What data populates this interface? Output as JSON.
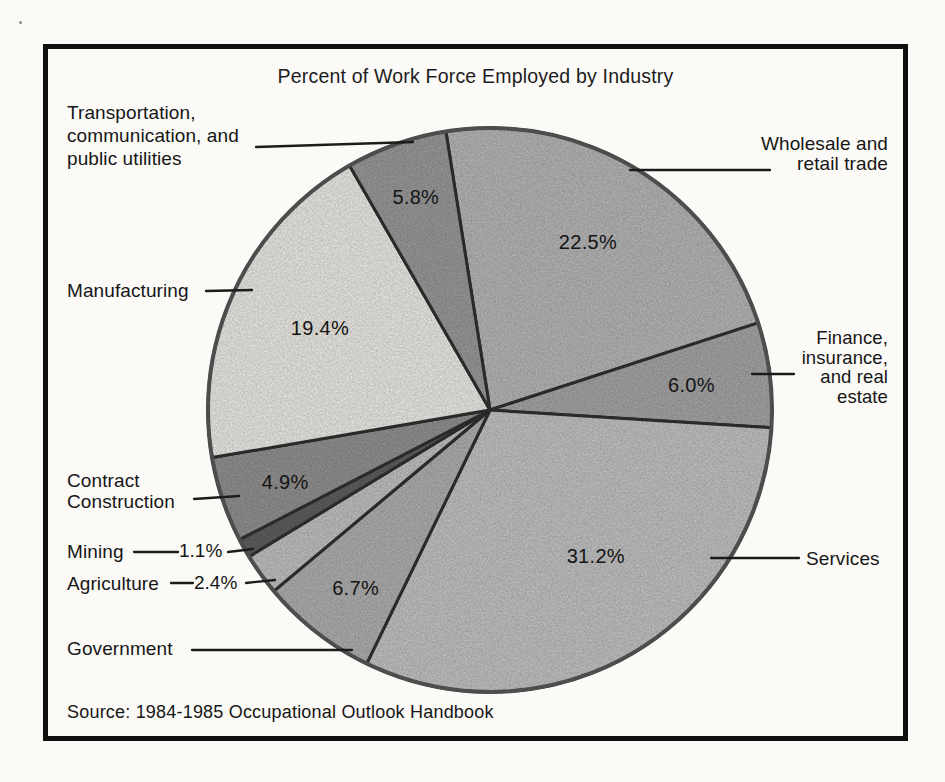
{
  "figure": {
    "title": "Percent of Work Force Employed by Industry",
    "source": "Source: 1984-1985 Occupational Outlook Handbook"
  },
  "chart_data": {
    "type": "pie",
    "title": "Percent of Work Force Employed by Industry",
    "unit": "percent of work force",
    "start_angle_deg": -9,
    "direction": "clockwise",
    "legend_position": "outside-callouts",
    "slices": [
      {
        "key": "wholesale",
        "label": "Wholesale and retail trade",
        "value": 22.5,
        "pct": "22.5%",
        "fill": "#b3b3b3",
        "pct_pos": {
          "angle": 30.2,
          "rf": 0.69
        }
      },
      {
        "key": "finance",
        "label": "Finance, insurance, and real estate",
        "value": 6.0,
        "pct": "6.0%",
        "fill": "#a2a2a2",
        "pct_pos": {
          "angle": 82.9,
          "rf": 0.72
        }
      },
      {
        "key": "services",
        "label": "Services",
        "value": 31.2,
        "pct": "31.2%",
        "fill": "#bfbfbf",
        "pct_pos": {
          "angle": 144.1,
          "rf": 0.64
        }
      },
      {
        "key": "government",
        "label": "Government",
        "value": 6.7,
        "pct": "6.7%",
        "fill": "#acacac",
        "pct_pos": {
          "angle": 217.1,
          "rf": 0.79
        }
      },
      {
        "key": "agriculture",
        "label": "Agriculture",
        "value": 2.4,
        "pct": "2.4%",
        "fill": "#bdbdbd",
        "pct_pos": null
      },
      {
        "key": "mining",
        "label": "Mining",
        "value": 1.1,
        "pct": "1.1%",
        "fill": "#5d5d5d",
        "pct_pos": null
      },
      {
        "key": "contract",
        "label": "Contract Construction",
        "value": 4.9,
        "pct": "4.9%",
        "fill": "#8f8f8f",
        "pct_pos": {
          "angle": 250.6,
          "rf": 0.77
        }
      },
      {
        "key": "manufacturing",
        "label": "Manufacturing",
        "value": 19.4,
        "pct": "19.4%",
        "fill": "#e8e6e1",
        "pct_pos": {
          "angle": 295.8,
          "rf": 0.67
        }
      },
      {
        "key": "transportation",
        "label": "Transportation, communication, and public utilities",
        "value": 5.8,
        "pct": "5.8%",
        "fill": "#979797",
        "pct_pos": {
          "angle": 340.8,
          "rf": 0.8
        }
      }
    ]
  },
  "callouts": {
    "transportation": "Transportation,\ncommunication, and\npublic utilities",
    "wholesale": "Wholesale and\nretail trade",
    "finance": "Finance,\ninsurance,\nand real\nestate",
    "services": "Services",
    "manufacturing": "Manufacturing",
    "contract": "Contract\nConstruction",
    "mining": "Mining",
    "agriculture": "Agriculture",
    "government": "Government"
  },
  "colors": {
    "frame": "#101010",
    "slice_stroke": "#2f2f2f",
    "circle_stroke": "#4d4d4d",
    "leader_line": "#1c1c1c"
  }
}
